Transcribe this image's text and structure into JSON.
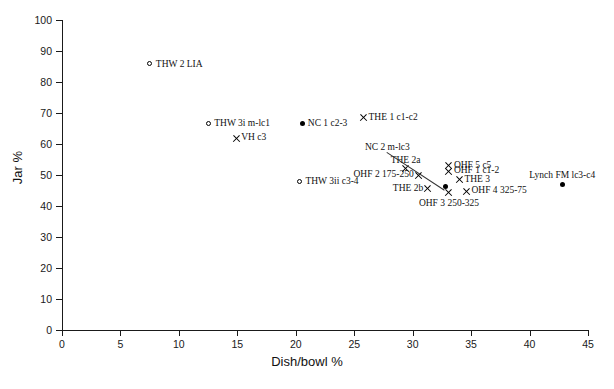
{
  "chart_data": {
    "type": "scatter",
    "title": "",
    "xlabel": "Dish/bowl %",
    "ylabel": "Jar %",
    "xlim": [
      0,
      45
    ],
    "ylim": [
      0,
      100
    ],
    "xticks": [
      0,
      5,
      10,
      15,
      20,
      25,
      30,
      35,
      40,
      45
    ],
    "yticks": [
      0,
      10,
      20,
      30,
      40,
      50,
      60,
      70,
      80,
      90,
      100
    ],
    "grid": false,
    "legend": "none",
    "marker_styles": {
      "open-circle": "open circle",
      "filled-circle": "filled circle",
      "cross": "x cross"
    },
    "points": [
      {
        "label": "THW 2 LIA",
        "x": 7.6,
        "y": 85.5,
        "marker": "open-circle",
        "label_side": "right"
      },
      {
        "label": "THW 3i m-lc1",
        "x": 12.6,
        "y": 66.3,
        "marker": "open-circle",
        "label_side": "right"
      },
      {
        "label": "VH c3",
        "x": 14.9,
        "y": 61.8,
        "marker": "cross",
        "label_side": "right"
      },
      {
        "label": "NC 1 c2-3",
        "x": 20.6,
        "y": 66.5,
        "marker": "filled-circle",
        "label_side": "right"
      },
      {
        "label": "THE 1 c1-c2",
        "x": 25.8,
        "y": 68.4,
        "marker": "cross",
        "label_side": "right"
      },
      {
        "label": "THW 3ii c3-4",
        "x": 20.4,
        "y": 47.6,
        "marker": "open-circle",
        "label_side": "right"
      },
      {
        "label": "THE 2a",
        "x": 29.4,
        "y": 52.0,
        "marker": "cross",
        "label_side": "above"
      },
      {
        "label": "OHF 2 175-250",
        "x": 30.5,
        "y": 50.0,
        "marker": "cross",
        "label_side": "left"
      },
      {
        "label": "NC 2 m-lc3",
        "x": 32.8,
        "y": 46.3,
        "marker": "filled-circle",
        "label_side": "leader"
      },
      {
        "label": "OHF 5 c5",
        "x": 33.1,
        "y": 53.0,
        "marker": "cross",
        "label_side": "right"
      },
      {
        "label": "OHF 1 c1-2",
        "x": 33.1,
        "y": 51.2,
        "marker": "cross",
        "label_side": "right"
      },
      {
        "label": "THE 3",
        "x": 34.0,
        "y": 48.5,
        "marker": "cross",
        "label_side": "right"
      },
      {
        "label": "THE 2b",
        "x": 31.3,
        "y": 45.5,
        "marker": "cross",
        "label_side": "left"
      },
      {
        "label": "OHF 3 250-325",
        "x": 33.1,
        "y": 44.3,
        "marker": "cross",
        "label_side": "below"
      },
      {
        "label": "OHF 4 325-75",
        "x": 34.6,
        "y": 44.8,
        "marker": "cross",
        "label_side": "right"
      },
      {
        "label": "Lynch FM lc3-c4",
        "x": 42.8,
        "y": 47.0,
        "marker": "filled-circle",
        "label_side": "above"
      }
    ]
  }
}
